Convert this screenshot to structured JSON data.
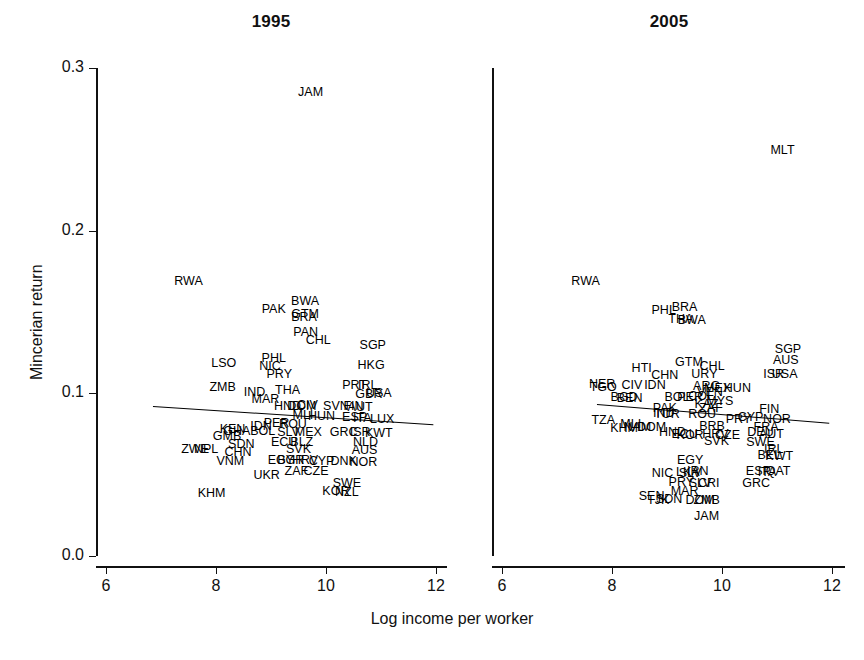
{
  "figure": {
    "xlabel": "Log income per worker",
    "ylabel": "Mincerian return"
  },
  "chart_data": {
    "type": "scatter",
    "title": "",
    "xlabel": "Log income per worker",
    "ylabel": "Mincerian return",
    "xlim": [
      6,
      12
    ],
    "ylim": [
      0.0,
      0.3
    ],
    "xticks": [
      6,
      8,
      10,
      12
    ],
    "xtick_labels": [
      "6",
      "8",
      "10",
      "12"
    ],
    "yticks": [
      0.0,
      0.1,
      0.2,
      0.3
    ],
    "ytick_labels": [
      "0.0",
      "0.1",
      "0.2",
      "0.3"
    ],
    "grid": false,
    "legend": null,
    "marker_style": "text-label (ISO3 country code)",
    "panels": [
      {
        "name": "1995",
        "title": "1995",
        "fit_line": {
          "x": [
            6.85,
            11.95
          ],
          "y": [
            0.0923,
            0.081
          ]
        },
        "points": [
          {
            "label": "JAM",
            "x": 9.72,
            "y": 0.2855
          },
          {
            "label": "RWA",
            "x": 7.5,
            "y": 0.169
          },
          {
            "label": "PAK",
            "x": 9.05,
            "y": 0.152
          },
          {
            "label": "BWA",
            "x": 9.62,
            "y": 0.157
          },
          {
            "label": "GTM",
            "x": 9.62,
            "y": 0.1485
          },
          {
            "label": "BRA",
            "x": 9.6,
            "y": 0.147
          },
          {
            "label": "PAN",
            "x": 9.63,
            "y": 0.138
          },
          {
            "label": "CHL",
            "x": 9.86,
            "y": 0.133
          },
          {
            "label": "SGP",
            "x": 10.85,
            "y": 0.1295
          },
          {
            "label": "LSO",
            "x": 8.14,
            "y": 0.1185
          },
          {
            "label": "PHL",
            "x": 9.05,
            "y": 0.1215
          },
          {
            "label": "NIC",
            "x": 8.98,
            "y": 0.117
          },
          {
            "label": "HKG",
            "x": 10.82,
            "y": 0.1175
          },
          {
            "label": "PRY",
            "x": 9.15,
            "y": 0.112
          },
          {
            "label": "ZMB",
            "x": 8.12,
            "y": 0.104
          },
          {
            "label": "IND",
            "x": 8.7,
            "y": 0.101
          },
          {
            "label": "THA",
            "x": 9.3,
            "y": 0.102
          },
          {
            "label": "PRT",
            "x": 10.52,
            "y": 0.105
          },
          {
            "label": "IRL",
            "x": 10.76,
            "y": 0.105
          },
          {
            "label": "GBR",
            "x": 10.78,
            "y": 0.0995
          },
          {
            "label": "USA",
            "x": 10.96,
            "y": 0.1
          },
          {
            "label": "MAR",
            "x": 8.9,
            "y": 0.0965
          },
          {
            "label": "HND",
            "x": 9.3,
            "y": 0.092
          },
          {
            "label": "DOM",
            "x": 9.56,
            "y": 0.092
          },
          {
            "label": "CIV",
            "x": 9.66,
            "y": 0.093
          },
          {
            "label": "SVN",
            "x": 10.18,
            "y": 0.0925
          },
          {
            "label": "FIN",
            "x": 10.5,
            "y": 0.092
          },
          {
            "label": "AUT",
            "x": 10.62,
            "y": 0.0915
          },
          {
            "label": "MLI",
            "x": 9.58,
            "y": 0.0865
          },
          {
            "label": "HUN",
            "x": 9.92,
            "y": 0.086
          },
          {
            "label": "ESP",
            "x": 10.52,
            "y": 0.0855
          },
          {
            "label": "ITA",
            "x": 10.66,
            "y": 0.085
          },
          {
            "label": "LUX",
            "x": 11.02,
            "y": 0.084
          },
          {
            "label": "PER",
            "x": 9.1,
            "y": 0.0815
          },
          {
            "label": "ROU",
            "x": 9.4,
            "y": 0.081
          },
          {
            "label": "IDN",
            "x": 8.82,
            "y": 0.08
          },
          {
            "label": "BOL",
            "x": 8.85,
            "y": 0.077
          },
          {
            "label": "SLV",
            "x": 9.32,
            "y": 0.0765
          },
          {
            "label": "MEX",
            "x": 9.68,
            "y": 0.076
          },
          {
            "label": "GRC",
            "x": 10.32,
            "y": 0.076
          },
          {
            "label": "ISR",
            "x": 10.62,
            "y": 0.0765
          },
          {
            "label": "KWT",
            "x": 10.96,
            "y": 0.0755
          },
          {
            "label": "KEN",
            "x": 8.3,
            "y": 0.078
          },
          {
            "label": "GHA",
            "x": 8.38,
            "y": 0.077
          },
          {
            "label": "GMB",
            "x": 8.2,
            "y": 0.0735
          },
          {
            "label": "ECU",
            "x": 9.24,
            "y": 0.07
          },
          {
            "label": "BLZ",
            "x": 9.56,
            "y": 0.07
          },
          {
            "label": "NLD",
            "x": 10.72,
            "y": 0.07
          },
          {
            "label": "SDN",
            "x": 8.46,
            "y": 0.069
          },
          {
            "label": "ZWE",
            "x": 7.62,
            "y": 0.0655
          },
          {
            "label": "NPL",
            "x": 7.82,
            "y": 0.0655
          },
          {
            "label": "CHN",
            "x": 8.4,
            "y": 0.064
          },
          {
            "label": "SVK",
            "x": 9.5,
            "y": 0.0655
          },
          {
            "label": "AUS",
            "x": 10.7,
            "y": 0.065
          },
          {
            "label": "VNM",
            "x": 8.26,
            "y": 0.0585
          },
          {
            "label": "EGY",
            "x": 9.18,
            "y": 0.059
          },
          {
            "label": "BGR",
            "x": 9.36,
            "y": 0.059
          },
          {
            "label": "HRV",
            "x": 9.62,
            "y": 0.059
          },
          {
            "label": "CYP",
            "x": 9.92,
            "y": 0.0585
          },
          {
            "label": "DNK",
            "x": 10.32,
            "y": 0.0585
          },
          {
            "label": "NOR",
            "x": 10.68,
            "y": 0.058
          },
          {
            "label": "ZAF",
            "x": 9.46,
            "y": 0.052
          },
          {
            "label": "CZE",
            "x": 9.82,
            "y": 0.052
          },
          {
            "label": "UKR",
            "x": 8.92,
            "y": 0.05
          },
          {
            "label": "SWE",
            "x": 10.38,
            "y": 0.045
          },
          {
            "label": "KOR",
            "x": 10.18,
            "y": 0.04
          },
          {
            "label": "NZL",
            "x": 10.38,
            "y": 0.0395
          },
          {
            "label": "KHM",
            "x": 7.92,
            "y": 0.039
          }
        ]
      },
      {
        "name": "2005",
        "title": "2005",
        "fit_line": {
          "x": [
            7.72,
            11.95
          ],
          "y": [
            0.0935,
            0.082
          ]
        },
        "points": [
          {
            "label": "MLT",
            "x": 11.1,
            "y": 0.2495
          },
          {
            "label": "RWA",
            "x": 7.52,
            "y": 0.169
          },
          {
            "label": "PHL",
            "x": 8.94,
            "y": 0.151
          },
          {
            "label": "BRA",
            "x": 9.32,
            "y": 0.153
          },
          {
            "label": "THA",
            "x": 9.25,
            "y": 0.146
          },
          {
            "label": "BWA",
            "x": 9.45,
            "y": 0.145
          },
          {
            "label": "SGP",
            "x": 11.2,
            "y": 0.1275
          },
          {
            "label": "AUS",
            "x": 11.16,
            "y": 0.1205
          },
          {
            "label": "GTM",
            "x": 9.4,
            "y": 0.1195
          },
          {
            "label": "HTI",
            "x": 8.54,
            "y": 0.1155
          },
          {
            "label": "CHL",
            "x": 9.82,
            "y": 0.1165
          },
          {
            "label": "URY",
            "x": 9.68,
            "y": 0.112
          },
          {
            "label": "ISR",
            "x": 10.94,
            "y": 0.112
          },
          {
            "label": "USA",
            "x": 11.14,
            "y": 0.112
          },
          {
            "label": "CHN",
            "x": 8.96,
            "y": 0.1115
          },
          {
            "label": "NER",
            "x": 7.82,
            "y": 0.106
          },
          {
            "label": "TGO",
            "x": 7.84,
            "y": 0.104
          },
          {
            "label": "CIV",
            "x": 8.36,
            "y": 0.105
          },
          {
            "label": "IDN",
            "x": 8.78,
            "y": 0.105
          },
          {
            "label": "ARG",
            "x": 9.72,
            "y": 0.1045
          },
          {
            "label": "VEN",
            "x": 9.78,
            "y": 0.101
          },
          {
            "label": "MEX",
            "x": 9.92,
            "y": 0.1035
          },
          {
            "label": "HUN",
            "x": 10.28,
            "y": 0.103
          },
          {
            "label": "COL",
            "x": 9.62,
            "y": 0.0985
          },
          {
            "label": "BOL",
            "x": 9.18,
            "y": 0.0975
          },
          {
            "label": "PER",
            "x": 9.42,
            "y": 0.098
          },
          {
            "label": "BGD",
            "x": 8.22,
            "y": 0.0975
          },
          {
            "label": "BEN",
            "x": 8.32,
            "y": 0.097
          },
          {
            "label": "MYS",
            "x": 9.96,
            "y": 0.095
          },
          {
            "label": "KAZ",
            "x": 9.72,
            "y": 0.0935
          },
          {
            "label": "PAK",
            "x": 8.96,
            "y": 0.091
          },
          {
            "label": "ZAF",
            "x": 9.8,
            "y": 0.091
          },
          {
            "label": "FIN",
            "x": 10.86,
            "y": 0.0905
          },
          {
            "label": "IND",
            "x": 8.94,
            "y": 0.088
          },
          {
            "label": "TUR",
            "x": 9.0,
            "y": 0.0875
          },
          {
            "label": "ROU",
            "x": 9.64,
            "y": 0.087
          },
          {
            "label": "CYP",
            "x": 10.52,
            "y": 0.0855
          },
          {
            "label": "PRY",
            "x": 10.3,
            "y": 0.084
          },
          {
            "label": "NOR",
            "x": 11.0,
            "y": 0.084
          },
          {
            "label": "TZA",
            "x": 7.84,
            "y": 0.0835
          },
          {
            "label": "MLI",
            "x": 8.34,
            "y": 0.081
          },
          {
            "label": "KHM",
            "x": 8.22,
            "y": 0.0785
          },
          {
            "label": "NAM",
            "x": 8.46,
            "y": 0.079
          },
          {
            "label": "DOM",
            "x": 8.72,
            "y": 0.079
          },
          {
            "label": "BRB",
            "x": 9.82,
            "y": 0.08
          },
          {
            "label": "FRA",
            "x": 10.8,
            "y": 0.079
          },
          {
            "label": "HND",
            "x": 9.1,
            "y": 0.076
          },
          {
            "label": "ECU",
            "x": 9.32,
            "y": 0.075
          },
          {
            "label": "KOR",
            "x": 9.42,
            "y": 0.0745
          },
          {
            "label": "HRV",
            "x": 9.88,
            "y": 0.075
          },
          {
            "label": "CZE",
            "x": 10.1,
            "y": 0.0745
          },
          {
            "label": "DEU",
            "x": 10.7,
            "y": 0.076
          },
          {
            "label": "AUT",
            "x": 10.9,
            "y": 0.075
          },
          {
            "label": "SVK",
            "x": 9.9,
            "y": 0.0705
          },
          {
            "label": "SWE",
            "x": 10.7,
            "y": 0.07
          },
          {
            "label": "IRL",
            "x": 10.94,
            "y": 0.066
          },
          {
            "label": "BEL",
            "x": 10.86,
            "y": 0.062
          },
          {
            "label": "KWT",
            "x": 11.04,
            "y": 0.0615
          },
          {
            "label": "EGY",
            "x": 9.42,
            "y": 0.059
          },
          {
            "label": "NIC",
            "x": 8.92,
            "y": 0.051
          },
          {
            "label": "LKA",
            "x": 9.38,
            "y": 0.0515
          },
          {
            "label": "IRN",
            "x": 9.56,
            "y": 0.052
          },
          {
            "label": "SLV",
            "x": 9.42,
            "y": 0.051
          },
          {
            "label": "ESP",
            "x": 10.66,
            "y": 0.052
          },
          {
            "label": "ITA",
            "x": 10.82,
            "y": 0.0515
          },
          {
            "label": "QAT",
            "x": 11.02,
            "y": 0.052
          },
          {
            "label": "PRY",
            "x": 9.26,
            "y": 0.0455
          },
          {
            "label": "SLV",
            "x": 9.6,
            "y": 0.045
          },
          {
            "label": "CRI",
            "x": 9.76,
            "y": 0.045
          },
          {
            "label": "GRC",
            "x": 10.62,
            "y": 0.045
          },
          {
            "label": "MAR",
            "x": 9.32,
            "y": 0.04
          },
          {
            "label": "SEN",
            "x": 8.72,
            "y": 0.037
          },
          {
            "label": "SDN",
            "x": 9.04,
            "y": 0.035
          },
          {
            "label": "TJK",
            "x": 8.84,
            "y": 0.0345
          },
          {
            "label": "DOM",
            "x": 9.6,
            "y": 0.0345
          },
          {
            "label": "ZMB",
            "x": 9.72,
            "y": 0.0345
          },
          {
            "label": "JAM",
            "x": 9.72,
            "y": 0.0245
          }
        ]
      }
    ]
  }
}
